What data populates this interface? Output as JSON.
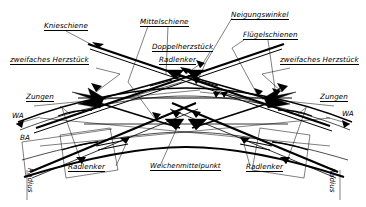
{
  "figure": {
    "type": "technical-drawing",
    "background_color": "#ffffff",
    "line_color": "#000000",
    "fill_color": "#000000"
  },
  "labels": {
    "knieschiene": "Knieschiene",
    "mittelschiene": "Mittelschiene",
    "neigungswinkel": "Neigungswinkel",
    "fluegelschienen": "Flügelschienen",
    "doppelherzstueck": "Doppelherzstück",
    "radlenker_top": "Radlenker",
    "zweifaches_herzstueck_left": "zweifaches Herzstück",
    "zweifaches_herzstueck_right": "zweifaches Herzstück",
    "zungen_left": "Zungen",
    "zungen_right": "Zungen",
    "wa_left": "WA",
    "wa_right": "WA",
    "ba_left": "BA",
    "radius_left": "Radius",
    "radius_right": "Radius",
    "radlenker_bottom_left": "Radlenker",
    "radlenker_bottom_right": "Radlenker",
    "weichenmittelpunkt": "Weichenmittelpunkt"
  }
}
